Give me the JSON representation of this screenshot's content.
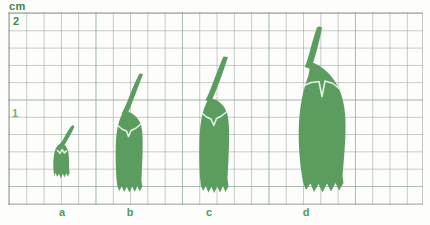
{
  "figure": {
    "background_color": "#fdfdfb",
    "paper_color": "#fdfdfc"
  },
  "axis": {
    "unit_label": "cm",
    "unit_color": "#3f8a4a",
    "ticks": [
      {
        "id": "tick-2",
        "label": "2",
        "value": 2
      },
      {
        "id": "tick-1",
        "label": "1",
        "value": 1
      }
    ]
  },
  "grid": {
    "minor_cell_px": 17.3,
    "major_every_cells": 5,
    "minor_line_color": "#96a096",
    "major_line_color": "#78afa0",
    "left": 8,
    "top": 12,
    "width": 415,
    "height": 193
  },
  "specimens": [
    {
      "id": "a",
      "label": "a",
      "stage": 1,
      "body_height_cm": 0.55,
      "total_height_cm": 1.05,
      "body_width_cm": 0.3,
      "has_stalk": true,
      "has_white_notch": true,
      "sepal_points": 3
    },
    {
      "id": "b",
      "label": "b",
      "stage": 2,
      "body_height_cm": 1.05,
      "total_height_cm": 1.85,
      "body_width_cm": 0.55,
      "has_stalk": true,
      "has_white_notch": true,
      "sepal_points": 4
    },
    {
      "id": "c",
      "label": "c",
      "stage": 3,
      "body_height_cm": 1.2,
      "total_height_cm": 2.0,
      "body_width_cm": 0.65,
      "has_stalk": true,
      "has_white_notch": true,
      "sepal_points": 4
    },
    {
      "id": "d",
      "label": "d",
      "stage": 4,
      "body_height_cm": 1.75,
      "total_height_cm": 2.25,
      "body_width_cm": 1.05,
      "has_stalk": true,
      "has_white_notch": true,
      "sepal_points": 4
    }
  ],
  "colors": {
    "bud_fill": "#5a9d5e",
    "bud_fill_light": "#63a567",
    "notch_stroke": "#ddeedd",
    "label_text": "#4e9b58",
    "axis_text": "#3f8a4a"
  }
}
